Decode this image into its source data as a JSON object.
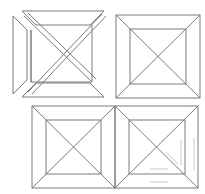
{
  "figure": {
    "stroke_color": "#7a7a7a",
    "faint_color": "#c8c8c8",
    "background": "#ffffff"
  },
  "panels": [
    {
      "id": "exploded",
      "label": ""
    },
    {
      "id": "assembled-top-right",
      "label": ""
    },
    {
      "id": "assembled-bottom-left",
      "label": ""
    },
    {
      "id": "assembled-bottom-right",
      "label": ""
    }
  ]
}
